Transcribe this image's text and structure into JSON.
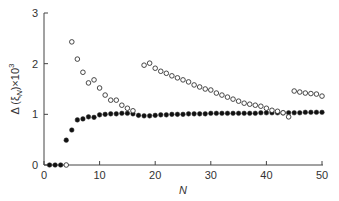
{
  "chart_data": {
    "type": "scatter",
    "title": "",
    "xlabel": "N",
    "ylabel": "Δ (ξN)×10³",
    "xlim": [
      0,
      50
    ],
    "ylim": [
      0,
      3
    ],
    "xticks": [
      0,
      10,
      20,
      30,
      40,
      50
    ],
    "yticks": [
      0,
      1,
      2,
      3
    ],
    "grid": false,
    "legend": null,
    "series": [
      {
        "name": "filled",
        "marker": "filled-circle",
        "x": [
          1,
          2,
          3,
          4,
          5,
          6,
          7,
          8,
          9,
          10,
          11,
          12,
          13,
          14,
          15,
          16,
          17,
          18,
          19,
          20,
          21,
          22,
          23,
          24,
          25,
          26,
          27,
          28,
          29,
          30,
          31,
          32,
          33,
          34,
          35,
          36,
          37,
          38,
          39,
          40,
          41,
          42,
          43,
          44,
          45,
          46,
          47,
          48,
          49,
          50
        ],
        "y": [
          0,
          0,
          0,
          0.49,
          0.69,
          0.89,
          0.91,
          0.95,
          0.94,
          0.99,
          1.0,
          1.01,
          1.01,
          1.02,
          1.02,
          1.01,
          0.98,
          0.97,
          0.97,
          0.98,
          0.99,
          0.99,
          1.0,
          1.0,
          1.0,
          1.01,
          1.01,
          1.01,
          1.01,
          1.02,
          1.02,
          1.02,
          1.02,
          1.02,
          1.02,
          1.02,
          1.02,
          1.02,
          1.03,
          1.03,
          1.03,
          1.03,
          1.03,
          1.03,
          1.03,
          1.03,
          1.04,
          1.04,
          1.04,
          1.04
        ]
      },
      {
        "name": "open",
        "marker": "open-circle",
        "x": [
          4,
          5,
          6,
          7,
          8,
          9,
          10,
          11,
          12,
          13,
          14,
          15,
          16,
          18,
          19,
          20,
          21,
          22,
          23,
          24,
          25,
          26,
          27,
          28,
          29,
          30,
          31,
          32,
          33,
          34,
          35,
          36,
          37,
          38,
          39,
          40,
          41,
          42,
          43,
          44,
          45,
          46,
          47,
          48,
          49,
          50
        ],
        "y": [
          0,
          2.43,
          2.09,
          1.83,
          1.62,
          1.68,
          1.52,
          1.38,
          1.28,
          1.28,
          1.18,
          1.12,
          1.07,
          1.97,
          2.01,
          1.91,
          1.85,
          1.81,
          1.76,
          1.72,
          1.68,
          1.64,
          1.58,
          1.54,
          1.5,
          1.48,
          1.42,
          1.38,
          1.34,
          1.3,
          1.26,
          1.22,
          1.2,
          1.18,
          1.16,
          1.12,
          1.08,
          1.06,
          1.03,
          0.95,
          1.46,
          1.44,
          1.42,
          1.41,
          1.4,
          1.36
        ]
      }
    ]
  },
  "axes": {
    "x_tick_labels": [
      "0",
      "10",
      "20",
      "30",
      "40",
      "50"
    ],
    "y_tick_labels": [
      "0",
      "1",
      "2",
      "3"
    ],
    "x_title": "N",
    "y_title_main": "Δ (ξ",
    "y_title_sub": "N",
    "y_title_tail": ")×10",
    "y_title_sup": "3"
  }
}
